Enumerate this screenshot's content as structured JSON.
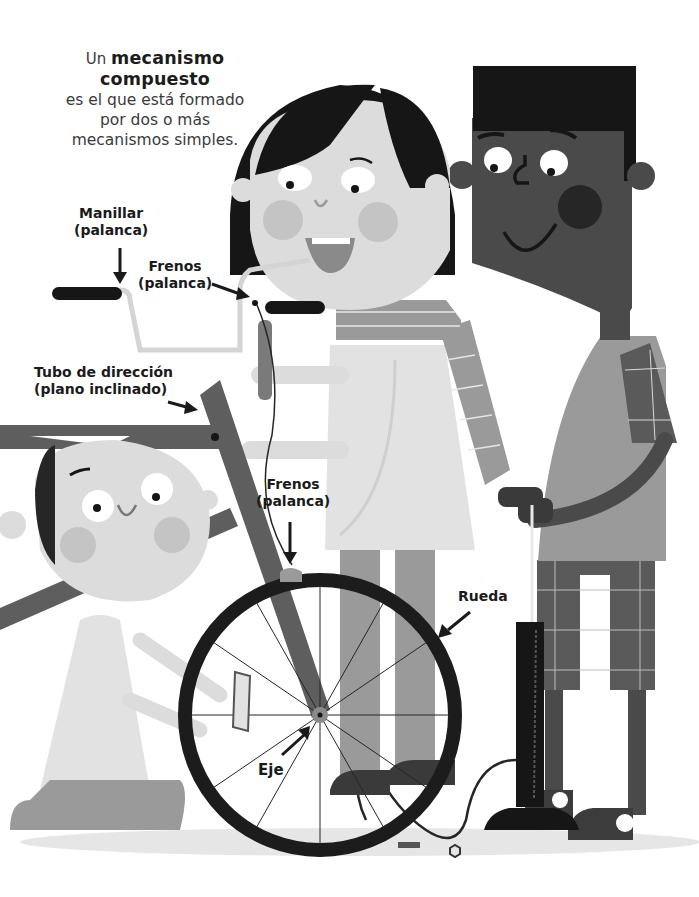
{
  "intro": {
    "lead": "Un",
    "term": "mecanismo compuesto",
    "line1": "es el que está formado",
    "line2": "por dos o más",
    "line3": "mecanismos simples."
  },
  "labels": {
    "handlebar": {
      "title": "Manillar",
      "type": "(palanca)"
    },
    "brakes_top": {
      "title": "Frenos",
      "type": "(palanca)"
    },
    "steering_tube": {
      "title": "Tubo de dirección",
      "type": "(plano inclinado)"
    },
    "brakes_bottom": {
      "title": "Frenos",
      "type": "(palanca)"
    },
    "wheel": {
      "title": "Rueda"
    },
    "axle": {
      "title": "Eje"
    }
  },
  "illustration": {
    "description": "Three children working on a bicycle: a girl holding the handlebar brake, a boy with a bicycle pump, and a kneeling child holding the front wheel",
    "colors": {
      "hair": "#1e1e1e",
      "dark_skin": "#4a4a4a",
      "light_skin": "#dcdcdc",
      "cheek": "#bdbdbd",
      "shirt": "#e2e2e2",
      "grey_shirt": "#9a9a9a",
      "frame": "#5e5e5e",
      "tire": "#1c1c1c",
      "ground": "#e6e6e6"
    }
  }
}
